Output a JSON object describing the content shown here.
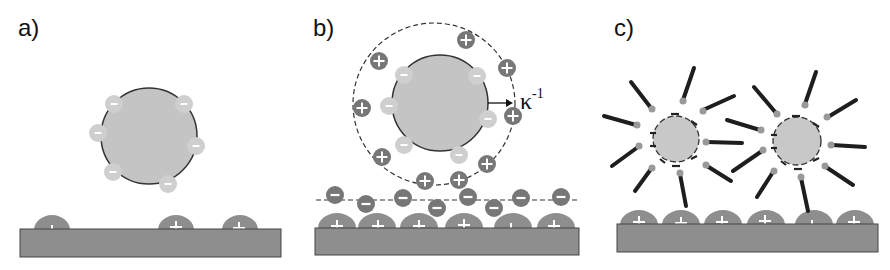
{
  "figure": {
    "panels": [
      {
        "id": "a",
        "label": "a)",
        "description": "Negatively charged particle above a substrate with sparse positive surface charges"
      },
      {
        "id": "b",
        "label": "b)",
        "description": "Charged particle surrounded by counter-ion cloud (dashed circle) with Debye length arrow; substrate with positive charges and a layer of negative ions"
      },
      {
        "id": "c",
        "label": "c)",
        "description": "Two particles with negative surface charges decorated by radially attached rod-like molecules above a positively charged substrate"
      }
    ],
    "annotations": {
      "debye_length_symbol": "κ",
      "debye_length_exponent": "-1"
    },
    "symbols": {
      "positive": "+",
      "negative": "−"
    },
    "colors": {
      "particle_fill": "#c4c4c4",
      "negative_blob": "#cfcfcf",
      "positive_ion": "#777777",
      "substrate": "#8e8e8e",
      "outline": "#333333",
      "rod": "#1e1e1e"
    }
  }
}
